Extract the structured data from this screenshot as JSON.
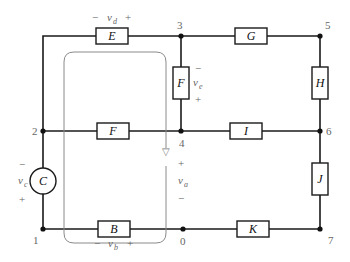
{
  "diagram": {
    "type": "circuit-schematic",
    "elements": [
      {
        "id": "B",
        "label": "B",
        "kind": "two-terminal",
        "between": [
          "1",
          "0"
        ]
      },
      {
        "id": "C",
        "label": "C",
        "kind": "source",
        "between": [
          "2",
          "1"
        ]
      },
      {
        "id": "D",
        "label": "D",
        "kind": "two-terminal",
        "between": [
          "2",
          "3"
        ]
      },
      {
        "id": "E",
        "label": "E",
        "kind": "two-terminal",
        "between": [
          "3",
          "4"
        ]
      },
      {
        "id": "F",
        "label": "F",
        "kind": "two-terminal",
        "between": [
          "2",
          "4"
        ]
      },
      {
        "id": "G",
        "label": "G",
        "kind": "two-terminal",
        "between": [
          "3",
          "5"
        ]
      },
      {
        "id": "H",
        "label": "H",
        "kind": "two-terminal",
        "between": [
          "5",
          "6"
        ]
      },
      {
        "id": "I",
        "label": "I",
        "kind": "two-terminal",
        "between": [
          "4",
          "6"
        ]
      },
      {
        "id": "J",
        "label": "J",
        "kind": "two-terminal",
        "between": [
          "6",
          "7"
        ]
      },
      {
        "id": "K",
        "label": "K",
        "kind": "two-terminal",
        "between": [
          "0",
          "7"
        ]
      }
    ],
    "nodes": [
      "0",
      "1",
      "2",
      "3",
      "4",
      "5",
      "6",
      "7"
    ],
    "voltages": [
      {
        "name": "v_d",
        "base": "v",
        "sub": "d",
        "minus": "−",
        "plus": "+"
      },
      {
        "name": "v_e",
        "base": "v",
        "sub": "e",
        "minus": "−",
        "plus": "+"
      },
      {
        "name": "v_c",
        "base": "v",
        "sub": "c",
        "minus": "−",
        "plus": "+"
      },
      {
        "name": "v_a",
        "base": "v",
        "sub": "a",
        "minus": "−",
        "plus": "+"
      },
      {
        "name": "v_b",
        "base": "v",
        "sub": "b",
        "minus": "−",
        "plus": "+"
      }
    ],
    "loop": {
      "direction": "clockwise",
      "arrow": "▽"
    }
  }
}
